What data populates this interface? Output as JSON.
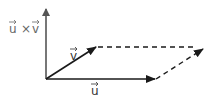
{
  "diagram": {
    "labels": {
      "cross": "u × v",
      "cross_u": "u",
      "cross_times": "×",
      "cross_v": "v",
      "v": "v",
      "u": "u"
    },
    "colors": {
      "axis": "#555555",
      "vector": "#1a1a1a",
      "dashed": "#1a1a1a",
      "label_cross": "#666666",
      "label": "#333333",
      "background": "#ffffff"
    },
    "geometry": {
      "origin": [
        46,
        79
      ],
      "cross_tip": [
        46,
        8
      ],
      "v_tip": [
        96,
        47
      ],
      "u_tip": [
        155,
        79
      ],
      "far_corner": [
        203,
        49
      ]
    }
  }
}
